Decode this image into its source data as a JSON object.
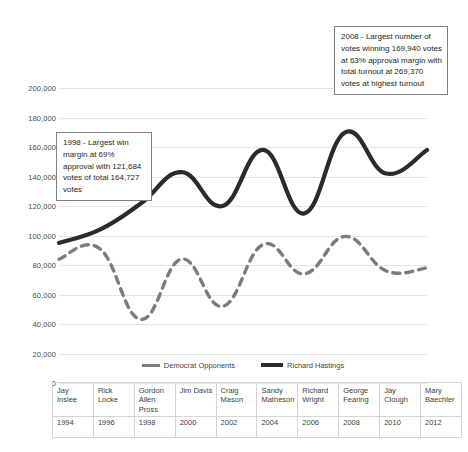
{
  "chart_data": {
    "type": "line",
    "title": "",
    "xlabel": "",
    "ylabel": "",
    "ylim": [
      0,
      200000
    ],
    "grid": true,
    "legend_position": "bottom",
    "categories": [
      "1994",
      "1996",
      "1998",
      "2000",
      "2002",
      "2004",
      "2006",
      "2008",
      "2010",
      "2012"
    ],
    "candidates": [
      "Jay Inslee",
      "Rick Locke",
      "Gordon Allen Pross",
      "Jim Davis",
      "Craig Mason",
      "Sandy Matheson",
      "Richard Wright",
      "George Fearing",
      "Jay Clough",
      "Mary Baechler"
    ],
    "series": [
      {
        "name": "Democrat Opponents",
        "style": "dashed",
        "color": "#7c7c7c",
        "values": [
          84000,
          91000,
          43043,
          84000,
          52000,
          94000,
          74000,
          99430,
          76000,
          78000
        ]
      },
      {
        "name": "Richard Hastings",
        "style": "solid",
        "color": "#2b2b2b",
        "values": [
          95000,
          104000,
          121684,
          143000,
          120000,
          158000,
          115000,
          169940,
          142000,
          158000
        ]
      }
    ],
    "y_ticks": [
      "0",
      "20,000",
      "40,000",
      "60,000",
      "80,000",
      "100,000",
      "120,000",
      "140,000",
      "160,000",
      "180,000",
      "200,000"
    ],
    "annotations": [
      {
        "id": "1998",
        "text": "1998 - Largest win margin at 69% approval with 121,684 votes of total 164,727 votes"
      },
      {
        "id": "2008",
        "text": "2008 - Largest number of votes winning 169,940 votes at 63% approval margin with total turnout at 269,370 votes at highest turnout"
      }
    ]
  },
  "legend": {
    "items": [
      {
        "label": "Democrat Opponents",
        "marker": "dashed-line-swatch"
      },
      {
        "label": "Richard Hastings",
        "marker": "solid-line-swatch"
      }
    ]
  },
  "table": {
    "names": [
      "Jay Inslee",
      "Rick Locke",
      "Gordon Allen Pross",
      "Jim Davis",
      "Craig Mason",
      "Sandy Matheson",
      "Richard Wright",
      "George Fearing",
      "Jay Clough",
      "Mary Baechler"
    ],
    "years": [
      "1994",
      "1996",
      "1998",
      "2000",
      "2002",
      "2004",
      "2006",
      "2008",
      "2010",
      "2012"
    ]
  },
  "colors": {
    "hastings_line": "#2b2b2b",
    "opponents_line": "#7c7c7c",
    "gridline": "#e4e4e4",
    "callout_border": "#7f7f7f",
    "text": "#3b3b3b",
    "background": "#ffffff"
  }
}
